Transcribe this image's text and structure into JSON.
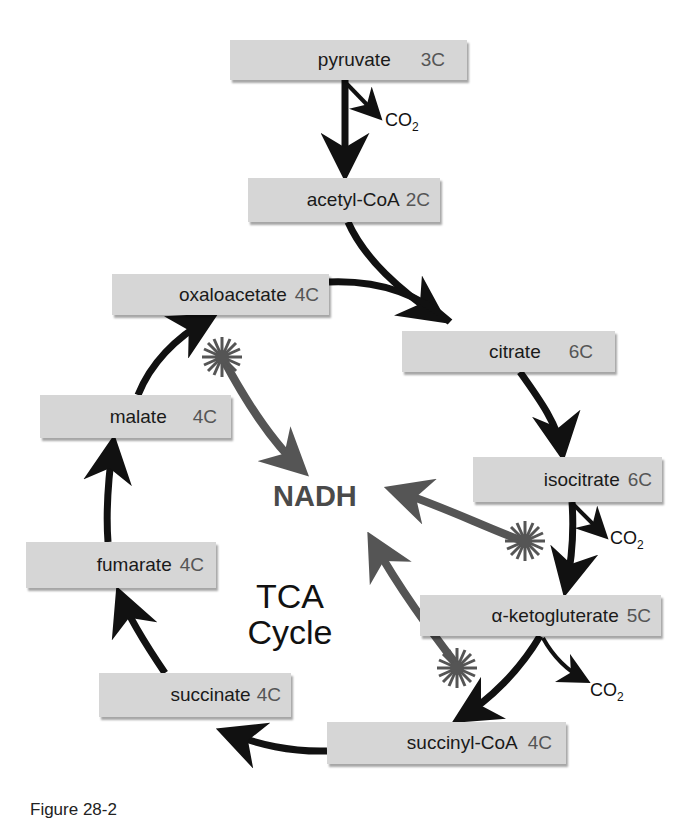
{
  "diagram": {
    "title_center": [
      "TCA",
      "Cycle"
    ],
    "product_label": "NADH",
    "byproduct_label": "CO",
    "byproduct_subscript": "2",
    "colors": {
      "box_fill": "#d6d6d6",
      "main_arrow": "#111111",
      "nadh_arrow": "#555555",
      "nadh_text": "#4a4a4a"
    },
    "metabolites": [
      {
        "id": "pyruvate",
        "name": "pyruvate",
        "carbons": "3C"
      },
      {
        "id": "acetyl-coa",
        "name": "acetyl-CoA",
        "carbons": "2C"
      },
      {
        "id": "oxaloacetate",
        "name": "oxaloacetate",
        "carbons": "4C"
      },
      {
        "id": "citrate",
        "name": "citrate",
        "carbons": "6C"
      },
      {
        "id": "malate",
        "name": "malate",
        "carbons": "4C"
      },
      {
        "id": "isocitrate",
        "name": "isocitrate",
        "carbons": "6C"
      },
      {
        "id": "fumarate",
        "name": "fumarate",
        "carbons": "4C"
      },
      {
        "id": "alpha-ketogluterate",
        "name": "α-ketogluterate",
        "carbons": "5C"
      },
      {
        "id": "succinate",
        "name": "succinate",
        "carbons": "4C"
      },
      {
        "id": "succinyl-coa",
        "name": "succinyl-CoA",
        "carbons": "4C"
      }
    ],
    "edges": [
      {
        "from": "pyruvate",
        "to": "acetyl-coa",
        "releases": "CO2"
      },
      {
        "from": "acetyl-coa",
        "to": "citrate",
        "joins": "oxaloacetate"
      },
      {
        "from": "citrate",
        "to": "isocitrate"
      },
      {
        "from": "isocitrate",
        "to": "alpha-ketogluterate",
        "releases": "CO2",
        "produces": "NADH"
      },
      {
        "from": "alpha-ketogluterate",
        "to": "succinyl-coa",
        "releases": "CO2",
        "produces": "NADH"
      },
      {
        "from": "succinyl-coa",
        "to": "succinate"
      },
      {
        "from": "succinate",
        "to": "fumarate"
      },
      {
        "from": "fumarate",
        "to": "malate"
      },
      {
        "from": "malate",
        "to": "oxaloacetate",
        "produces": "NADH"
      }
    ]
  },
  "caption": "Figure 28-2"
}
